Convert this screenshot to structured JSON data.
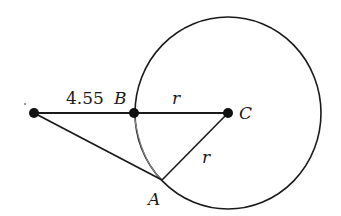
{
  "diagram": {
    "circle": {
      "cx": 228,
      "cy": 113,
      "rx": 93,
      "ry": 96,
      "stroke": "#1a1a1a"
    },
    "points": {
      "external": {
        "x": 34,
        "y": 113
      },
      "B": {
        "x": 134,
        "y": 113,
        "label": "B"
      },
      "C": {
        "x": 228,
        "y": 113,
        "label": "C"
      },
      "A": {
        "x": 162,
        "y": 180,
        "label": "A"
      }
    },
    "labels": {
      "external_to_B": "4.55",
      "B_to_C": "r",
      "C_to_A": "r",
      "B": "B",
      "C": "C",
      "A": "A"
    }
  }
}
